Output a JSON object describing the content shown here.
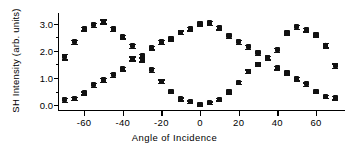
{
  "chart_data": {
    "type": "scatter",
    "title": "",
    "xlabel": "Angle of Incidence",
    "ylabel": "SH Intensity (arb. units)",
    "xlim": [
      -73,
      75
    ],
    "ylim": [
      -0.18,
      3.35
    ],
    "xticks": [
      -60,
      -40,
      -20,
      0,
      20,
      40,
      60
    ],
    "xticklabels": [
      "-60",
      "-40",
      "-20",
      "0",
      "20",
      "40",
      "60"
    ],
    "yticks": [
      0.0,
      1.0,
      2.0,
      3.0
    ],
    "yticklabels": [
      "0.0",
      "1.0",
      "2.0",
      "3.0"
    ],
    "yminorticks": [
      0.5,
      1.5,
      2.5
    ],
    "grid": false,
    "legend": false,
    "marker": "triangle",
    "errorbars": true,
    "color": "#111111",
    "series": [
      {
        "name": "series-a",
        "x": [
          -70,
          -65,
          -60,
          -55,
          -50,
          -45,
          -40,
          -35,
          -30,
          -25,
          -20,
          -15,
          -10,
          -5,
          0,
          5,
          10,
          15,
          20,
          25,
          30,
          35,
          40,
          45,
          50,
          55,
          60,
          65,
          70
        ],
        "y": [
          1.78,
          2.33,
          2.82,
          2.95,
          3.08,
          2.8,
          2.52,
          2.18,
          1.68,
          1.3,
          0.88,
          0.5,
          0.23,
          0.12,
          0.03,
          0.09,
          0.22,
          0.48,
          0.83,
          1.25,
          1.5,
          1.75,
          2.03,
          2.65,
          2.88,
          2.78,
          2.58,
          2.2,
          1.45
        ],
        "yerr": [
          0.1,
          0.08,
          0.07,
          0.07,
          0.07,
          0.07,
          0.07,
          0.07,
          0.07,
          0.07,
          0.07,
          0.06,
          0.06,
          0.05,
          0.05,
          0.05,
          0.05,
          0.06,
          0.06,
          0.07,
          0.07,
          0.07,
          0.07,
          0.07,
          0.07,
          0.07,
          0.07,
          0.08,
          0.08
        ]
      },
      {
        "name": "series-b",
        "x": [
          -70,
          -65,
          -60,
          -55,
          -50,
          -45,
          -40,
          -35,
          -30,
          -25,
          -20,
          -15,
          -10,
          -5,
          0,
          5,
          10,
          15,
          20,
          25,
          30,
          35,
          40,
          45,
          50,
          55,
          60,
          65,
          70
        ],
        "y": [
          0.2,
          0.25,
          0.45,
          0.75,
          0.92,
          1.12,
          1.35,
          1.72,
          1.82,
          2.12,
          2.32,
          2.45,
          2.68,
          2.82,
          3.0,
          3.02,
          2.85,
          2.55,
          2.33,
          2.15,
          1.92,
          1.73,
          1.38,
          1.18,
          0.98,
          0.78,
          0.5,
          0.33,
          0.27
        ],
        "yerr": [
          0.07,
          0.06,
          0.06,
          0.07,
          0.07,
          0.07,
          0.07,
          0.07,
          0.07,
          0.07,
          0.07,
          0.07,
          0.07,
          0.07,
          0.07,
          0.07,
          0.07,
          0.07,
          0.07,
          0.07,
          0.07,
          0.07,
          0.07,
          0.07,
          0.07,
          0.06,
          0.06,
          0.06,
          0.06
        ]
      }
    ]
  }
}
